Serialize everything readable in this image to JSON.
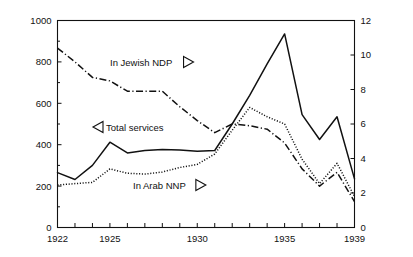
{
  "chart_data": {
    "type": "line",
    "title": "",
    "xlabel": "",
    "ylabel": "Total services (thousands of current P£)",
    "ylabel_right": "Percent",
    "xlim": [
      1922,
      1939
    ],
    "ylim": [
      0,
      1000
    ],
    "ylim_right": [
      0,
      12
    ],
    "grid": false,
    "legend_position": "inline-annotations",
    "x_ticks": [
      1922,
      1923,
      1924,
      1925,
      1926,
      1927,
      1928,
      1929,
      1930,
      1931,
      1932,
      1933,
      1934,
      1935,
      1936,
      1937,
      1938,
      1939
    ],
    "x_tick_labels": [
      "1922",
      "",
      "",
      "1925",
      "",
      "",
      "",
      "",
      "1930",
      "",
      "",
      "",
      "",
      "1935",
      "",
      "",
      "",
      "1939"
    ],
    "y_ticks_left": [
      0,
      200,
      400,
      600,
      800,
      1000
    ],
    "y_tick_labels_left": [
      "0",
      "200",
      "400",
      "600",
      "800",
      "1000"
    ],
    "y_ticks_right": [
      0,
      2,
      4,
      6,
      8,
      10,
      12
    ],
    "y_tick_labels_right": [
      "0",
      "2",
      "4",
      "6",
      "8",
      "10",
      "12"
    ],
    "x": [
      1922,
      1923,
      1924,
      1925,
      1926,
      1927,
      1928,
      1929,
      1930,
      1931,
      1932,
      1933,
      1934,
      1935,
      1936,
      1937,
      1938,
      1939
    ],
    "series": [
      {
        "name": "Total services",
        "label": "Total services",
        "axis": "left",
        "units": "thousands of current P£",
        "style": "solid",
        "marker_direction": "left",
        "values": [
          265,
          232,
          300,
          412,
          360,
          372,
          377,
          375,
          368,
          372,
          500,
          638,
          790,
          935,
          545,
          425,
          535,
          235
        ]
      },
      {
        "name": "In Jewish NDP",
        "label": "In Jewish NDP",
        "axis": "right",
        "units": "percent",
        "style": "dash-dot",
        "marker_direction": "right",
        "values": [
          10.4,
          9.6,
          8.7,
          8.5,
          7.9,
          7.9,
          7.9,
          7.0,
          6.2,
          5.5,
          6.0,
          5.9,
          5.7,
          4.9,
          3.4,
          2.4,
          3.2,
          1.5
        ]
      },
      {
        "name": "In Arab NNP",
        "label": "In Arab NNP",
        "axis": "left",
        "units": "percent",
        "style": "dotted",
        "marker_direction": "right",
        "values": [
          205,
          212,
          218,
          283,
          262,
          258,
          268,
          290,
          305,
          355,
          470,
          580,
          535,
          500,
          330,
          212,
          310,
          150
        ]
      }
    ],
    "annotations": [
      {
        "text": "In Jewish NDP",
        "marker": "triangle-right",
        "x_px": 110,
        "y_px": 62
      },
      {
        "text": "Total services",
        "marker": "triangle-left",
        "x_px": 93,
        "y_px": 127
      },
      {
        "text": "In Arab NNP",
        "marker": "triangle-right",
        "x_px": 133,
        "y_px": 185
      }
    ],
    "colors": {
      "line": "#111111",
      "axis": "#111111",
      "background": "#ffffff"
    }
  }
}
